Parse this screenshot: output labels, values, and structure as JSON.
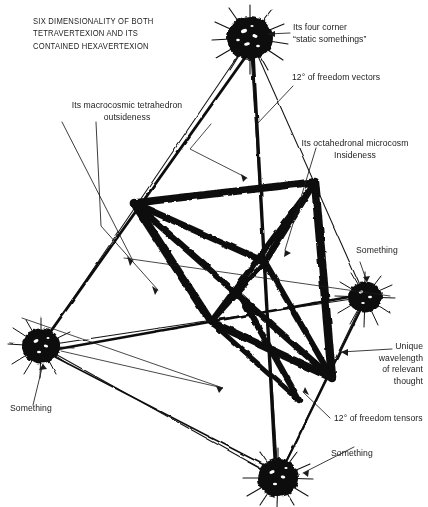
{
  "figure": {
    "title": "SIX DIMENSIONALITY OF BOTH\nTETRAVERTEXION AND ITS\nCONTAINED HEXAVERTEXION",
    "background_color": "#ffffff",
    "ink_color": "#111111",
    "annotations": {
      "four_corner": "Its four corner\n“static somethings”",
      "freedom_vectors": "12° of freedom vectors",
      "macrocosmic": "Its macrocosmic tetrahedron\noutsideness",
      "octahedronal": "Its octahedronal microcosm\nInsideness",
      "something_right": "Something",
      "unique_wavelength": "Unique\nwavelength\nof relevant\nthought",
      "freedom_tensors": "12° of freedom tensors",
      "something_bottom": "Something",
      "something_left": "Something"
    },
    "vertices": [
      {
        "name": "top-vertex",
        "label": "Its four corner static somethings",
        "cx": 250,
        "cy": 38,
        "r": 23
      },
      {
        "name": "left-vertex",
        "label": "Something",
        "cx": 41,
        "cy": 346,
        "r": 19
      },
      {
        "name": "right-vertex",
        "label": "Something",
        "cx": 365,
        "cy": 297,
        "r": 17
      },
      {
        "name": "bottom-vertex",
        "label": "Something",
        "cx": 278,
        "cy": 478,
        "r": 21
      }
    ],
    "octahedron_vertices": [
      {
        "name": "octa-top-left",
        "x": 134,
        "y": 203
      },
      {
        "name": "octa-top-right",
        "x": 315,
        "y": 182
      },
      {
        "name": "octa-front",
        "x": 265,
        "y": 262
      },
      {
        "name": "octa-bottom-left",
        "x": 211,
        "y": 322
      },
      {
        "name": "octa-bottom-right",
        "x": 332,
        "y": 378
      },
      {
        "name": "octa-back",
        "x": 243,
        "y": 300
      }
    ]
  }
}
